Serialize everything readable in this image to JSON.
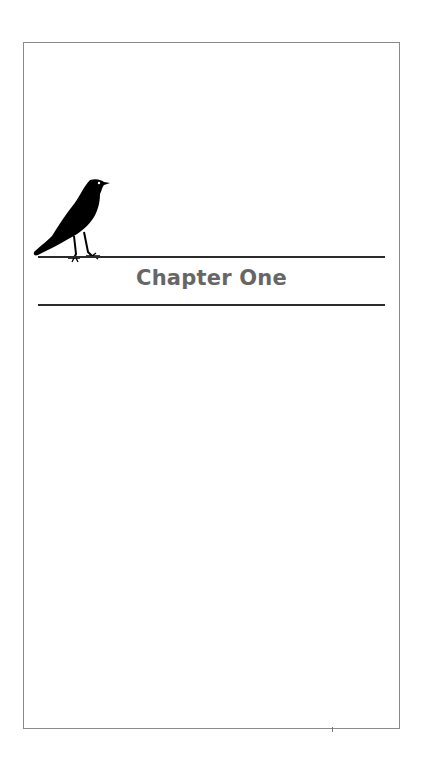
{
  "page": {
    "chapter_title": "Chapter One",
    "ornament_icon": "crow-on-wire",
    "colors": {
      "title": "#666666",
      "rule": "#2a2a2a",
      "border": "#8a8a8a"
    }
  }
}
